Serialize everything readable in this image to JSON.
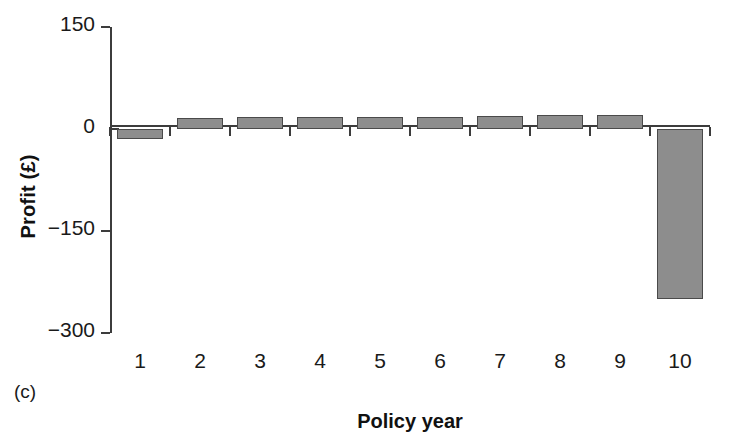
{
  "chart_data": {
    "type": "bar",
    "title": "",
    "panel_label": "(c)",
    "xlabel": "Policy year",
    "ylabel": "Profit (£)",
    "categories": [
      "1",
      "2",
      "3",
      "4",
      "5",
      "6",
      "7",
      "8",
      "9",
      "10"
    ],
    "values": [
      -15,
      16,
      17,
      17,
      18,
      18,
      19,
      20,
      20,
      -250
    ],
    "ylim": [
      -300,
      150
    ],
    "yticks": [
      150,
      0,
      -150,
      -300
    ],
    "ytick_labels": [
      "150",
      "0",
      "−150",
      "−300"
    ],
    "grid": false,
    "legend": false,
    "series": [
      {
        "name": "Profit",
        "values": [
          -15,
          16,
          17,
          17,
          18,
          18,
          19,
          20,
          20,
          -250
        ],
        "color": "#8d8d8d",
        "edge_color": "#4a4a4a"
      }
    ]
  }
}
